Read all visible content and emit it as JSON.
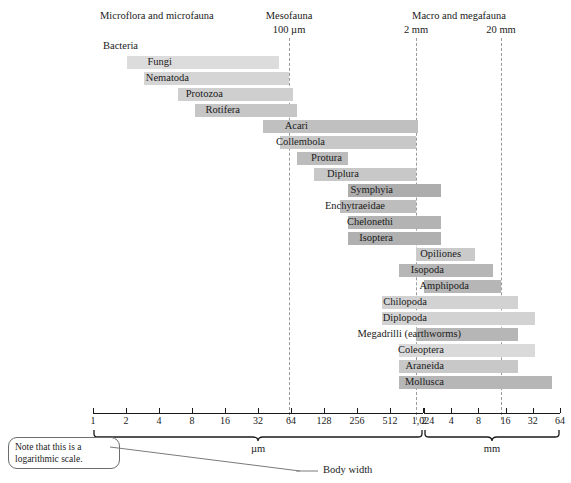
{
  "figure": {
    "axis_title": "Body width",
    "note": "Note that this is a\nlogarithmic scale."
  },
  "groups": [
    {
      "name": "Microflora and microfauna",
      "x": 100,
      "y": 10
    },
    {
      "name": "Mesofauna",
      "x": 289,
      "y": 10
    },
    {
      "name": "Macro and megafauna",
      "x": 459,
      "y": 10
    }
  ],
  "boundaries": [
    {
      "label": "100 µm",
      "x": 289
    },
    {
      "label": "2 mm",
      "x": 416
    },
    {
      "label": "20 mm",
      "x": 501
    }
  ],
  "axes": {
    "um": {
      "unit": "µm",
      "ticks": [
        "1",
        "2",
        "4",
        "8",
        "16",
        "32",
        "64",
        "128",
        "256",
        "512",
        "1,024"
      ],
      "x_start": 93,
      "x_end": 423
    },
    "mm": {
      "unit": "mm",
      "ticks": [
        "2",
        "4",
        "8",
        "16",
        "32",
        "64"
      ],
      "x_start": 424,
      "x_end": 560
    }
  },
  "chart_data": {
    "type": "bar",
    "xlabel": "Body width",
    "ylabel": "",
    "orientation": "horizontal",
    "scale": "log2",
    "grid": false,
    "legend": null,
    "annotations": [
      "Microflora and microfauna",
      "Mesofauna",
      "Macro and megafauna",
      "100 µm",
      "2 mm",
      "20 mm",
      "Note that this is a logarithmic scale."
    ],
    "x_axis_units": [
      "µm",
      "mm"
    ],
    "x_tick_labels_um": [
      1,
      2,
      4,
      8,
      16,
      32,
      64,
      128,
      256,
      512,
      1024
    ],
    "x_tick_labels_mm": [
      2,
      4,
      8,
      16,
      32,
      64
    ],
    "categories": [
      "Bacteria",
      "Fungi",
      "Nematoda",
      "Protozoa",
      "Rotifera",
      "Acari",
      "Collembola",
      "Protura",
      "Diplura",
      "Symphyia",
      "Enchytraeidae",
      "Chelonethi",
      "Isoptera",
      "Opiliones",
      "Isopoda",
      "Amphipoda",
      "Chilopoda",
      "Diplopoda",
      "Megadrilli (earthworms)",
      "Coleoptera",
      "Araneida",
      "Mollusca"
    ],
    "rows": [
      {
        "label": "Bacteria",
        "x0": 93,
        "x1": 93,
        "y": 40,
        "shade": "#e6e6e6"
      },
      {
        "label": "Fungi",
        "x0": 127,
        "x1": 279,
        "y": 56,
        "shade": "#dcdcdc"
      },
      {
        "label": "Nematoda",
        "x0": 144,
        "x1": 289,
        "y": 72,
        "shade": "#d5d5d5"
      },
      {
        "label": "Protozoa",
        "x0": 178,
        "x1": 293,
        "y": 88,
        "shade": "#cfcfcf"
      },
      {
        "label": "Rotifera",
        "x0": 195,
        "x1": 297,
        "y": 104,
        "shade": "#c6c6c6"
      },
      {
        "label": "Acari",
        "x0": 263,
        "x1": 418,
        "y": 120,
        "shade": "#c0c0c0"
      },
      {
        "label": "Collembola",
        "x0": 280,
        "x1": 416,
        "y": 136,
        "shade": "#c8c8c8"
      },
      {
        "label": "Protura",
        "x0": 297,
        "x1": 348,
        "y": 152,
        "shade": "#bcbcbc"
      },
      {
        "label": "Diplura",
        "x0": 314,
        "x1": 416,
        "y": 168,
        "shade": "#c8c8c8"
      },
      {
        "label": "Symphyia",
        "x0": 348,
        "x1": 441,
        "y": 184,
        "shade": "#adadad"
      },
      {
        "label": "Enchytraeidae",
        "x0": 340,
        "x1": 416,
        "y": 200,
        "shade": "#bdbdbd"
      },
      {
        "label": "Chelonethi",
        "x0": 348,
        "x1": 441,
        "y": 216,
        "shade": "#b3b3b3"
      },
      {
        "label": "Isoptera",
        "x0": 348,
        "x1": 441,
        "y": 232,
        "shade": "#b0b0b0"
      },
      {
        "label": "Opiliones",
        "x0": 416,
        "x1": 475,
        "y": 248,
        "shade": "#cacaca"
      },
      {
        "label": "Isopoda",
        "x0": 399,
        "x1": 493,
        "y": 264,
        "shade": "#b6b6b6"
      },
      {
        "label": "Amphipoda",
        "x0": 424,
        "x1": 501,
        "y": 280,
        "shade": "#b6b6b6"
      },
      {
        "label": "Chilopoda",
        "x0": 382,
        "x1": 518,
        "y": 296,
        "shade": "#d2d2d2"
      },
      {
        "label": "Diplopoda",
        "x0": 382,
        "x1": 535,
        "y": 312,
        "shade": "#d2d2d2"
      },
      {
        "label": "Megadrilli (earthworms)",
        "x0": 416,
        "x1": 518,
        "y": 328,
        "shade": "#b6b6b6"
      },
      {
        "label": "Coleoptera",
        "x0": 399,
        "x1": 535,
        "y": 344,
        "shade": "#dadada"
      },
      {
        "label": "Araneida",
        "x0": 399,
        "x1": 518,
        "y": 360,
        "shade": "#c8c8c8"
      },
      {
        "label": "Mollusca",
        "x0": 399,
        "x1": 552,
        "y": 376,
        "shade": "#b6b6b6"
      }
    ]
  }
}
